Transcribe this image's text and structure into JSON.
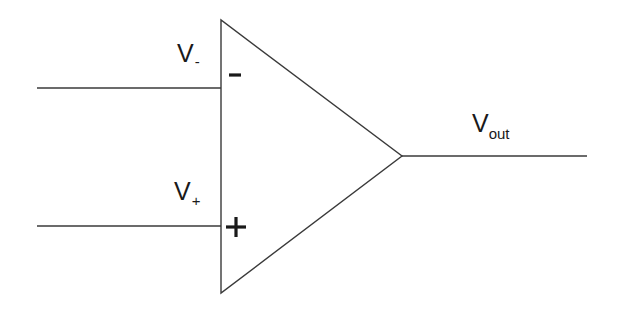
{
  "diagram": {
    "stroke_color": "#3a3a3a",
    "text_color": "#1a1a1a",
    "background": "#ffffff",
    "opamp": {
      "top": [
        221,
        20
      ],
      "bottom": [
        221,
        293
      ],
      "tip": [
        402,
        156
      ]
    },
    "inputs": [
      {
        "name": "inverting",
        "label_main": "V",
        "label_sub": "-",
        "symbol": "minus",
        "wire": {
          "x1": 37,
          "y": 88,
          "x2": 221
        }
      },
      {
        "name": "non-inverting",
        "label_main": "V",
        "label_sub": "+",
        "symbol": "plus",
        "wire": {
          "x1": 37,
          "y": 226,
          "x2": 221
        }
      }
    ],
    "output": {
      "label_main": "V",
      "label_sub": "out",
      "wire": {
        "x1": 402,
        "y": 156,
        "x2": 587
      }
    }
  }
}
